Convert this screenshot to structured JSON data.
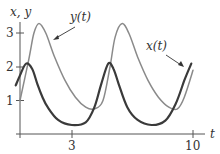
{
  "chart_data": {
    "type": "line",
    "title": "",
    "xlabel": "t",
    "ylabel": "x, y",
    "xlim": [
      0,
      10.5
    ],
    "ylim": [
      0,
      3.5
    ],
    "grid": false,
    "x_ticks": [
      3,
      10
    ],
    "y_ticks": [
      1,
      2,
      3
    ],
    "series": [
      {
        "name": "x(t)",
        "color": "#3a3a3a",
        "stroke_width": 2.2,
        "t": [
          -0.25,
          0.0,
          0.35,
          0.7,
          1.0,
          1.3,
          1.6,
          2.2,
          3.0,
          3.8,
          4.3,
          4.7,
          5.1,
          5.4,
          5.7,
          6.2,
          6.8,
          7.6,
          8.4,
          9.0,
          9.5,
          9.9
        ],
        "values": [
          1.45,
          1.75,
          2.1,
          1.95,
          1.5,
          1.1,
          0.8,
          0.42,
          0.27,
          0.35,
          0.8,
          1.5,
          2.1,
          1.95,
          1.5,
          0.8,
          0.42,
          0.27,
          0.4,
          0.9,
          1.6,
          2.1
        ]
      },
      {
        "name": "y(t)",
        "color": "#8a8a8a",
        "stroke_width": 1.5,
        "t": [
          0.0,
          0.5,
          0.8,
          1.1,
          1.5,
          2.0,
          2.6,
          3.2,
          3.8,
          4.3,
          4.8,
          5.2,
          5.5,
          5.9,
          6.3,
          6.8,
          7.4,
          8.0,
          8.6,
          9.1,
          9.5,
          10.0
        ],
        "values": [
          1.0,
          2.2,
          3.0,
          3.3,
          3.0,
          2.3,
          1.6,
          1.1,
          0.8,
          0.75,
          1.0,
          2.0,
          2.9,
          3.3,
          3.0,
          2.3,
          1.6,
          1.1,
          0.8,
          0.75,
          1.1,
          1.9
        ]
      }
    ],
    "annotations": [
      {
        "text": "y(t)",
        "arrow_to_series": "y(t)"
      },
      {
        "text": "x(t)",
        "arrow_to_series": "x(t)"
      }
    ]
  },
  "labels": {
    "axis_y": "x, y",
    "axis_x": "t",
    "tick_y_1": "1",
    "tick_y_2": "2",
    "tick_y_3": "3",
    "tick_x_3": "3",
    "tick_x_10": "10",
    "annot_y": "y(t)",
    "annot_x": "x(t)"
  }
}
